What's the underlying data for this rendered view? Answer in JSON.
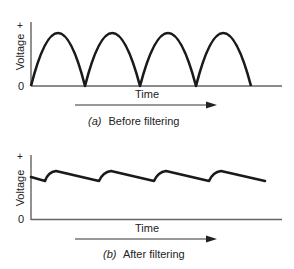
{
  "diagrams": [
    {
      "id": "a",
      "y_axis_label": "Voltage",
      "y_axis_top_mark": "+",
      "y_axis_zero_mark": "0",
      "x_axis_label": "Time",
      "caption_tag": "(a)",
      "caption_text": "Before filtering",
      "waveform": "full-wave rectified (4 half-sine arches)",
      "arches": 4
    },
    {
      "id": "b",
      "y_axis_label": "Voltage",
      "y_axis_top_mark": "+",
      "y_axis_zero_mark": "0",
      "x_axis_label": "Time",
      "caption_tag": "(b)",
      "caption_text": "After filtering",
      "waveform": "filtered DC with ripple (sawtooth-like)",
      "ripple_cycles": 4
    }
  ],
  "colors": {
    "line": "#1a1a1a",
    "axis": "#666666",
    "text": "#222222"
  }
}
